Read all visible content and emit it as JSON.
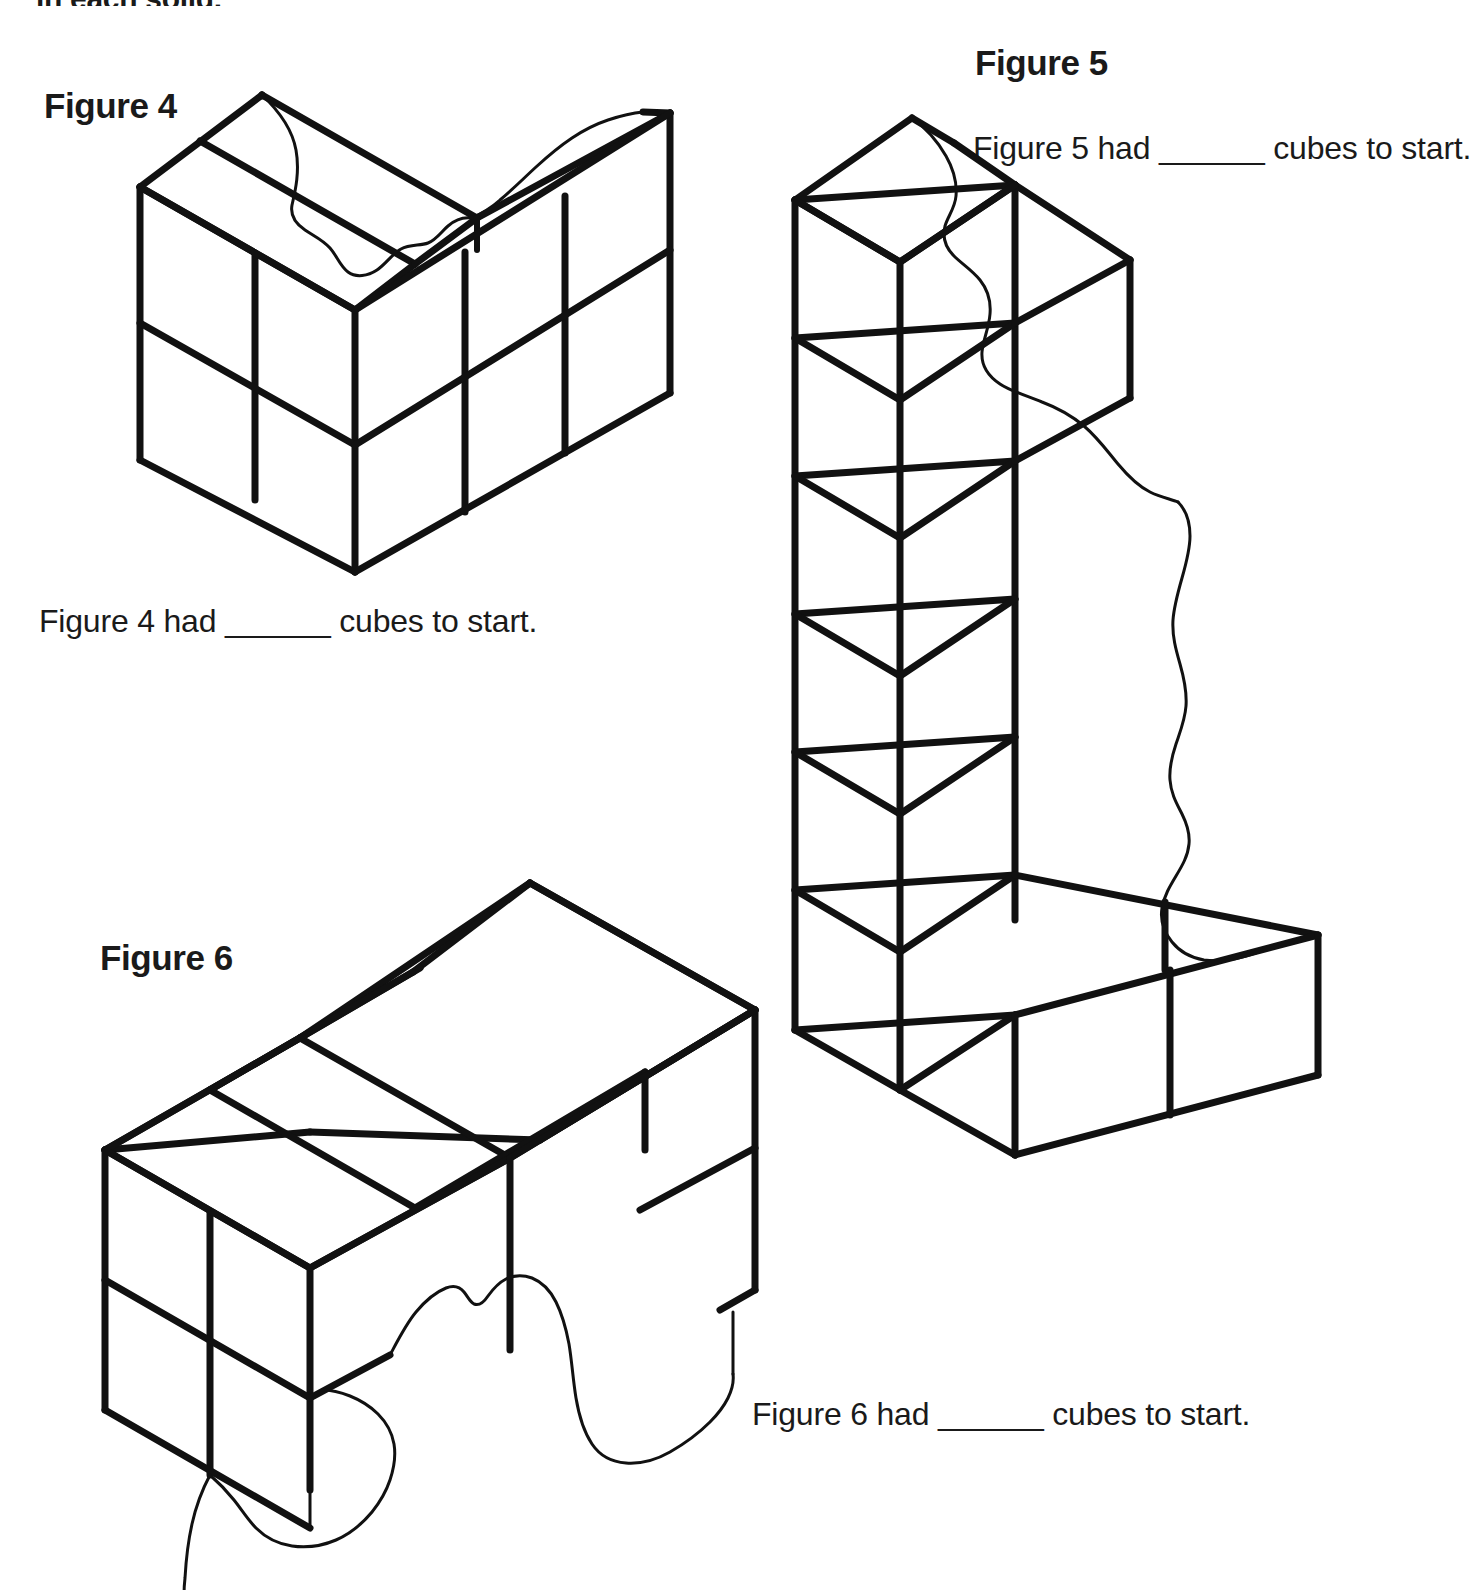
{
  "page": {
    "background_color": "#ffffff",
    "ink_color": "#111111",
    "intro_text_partial": "in each solid."
  },
  "figures": [
    {
      "id": "figure-4",
      "title": "Figure 4",
      "caption": "Figure 4 had ______ cubes to start.",
      "solid": {
        "type": "isometric-cube-stack",
        "description": "L-shaped stack of unit cubes, 2 cubes tall, with a torn/ripped top edge",
        "visible_front_columns": 2,
        "visible_right_columns": 2,
        "visible_rows": 2,
        "top_face_cells": 3
      }
    },
    {
      "id": "figure-5",
      "title": "Figure 5",
      "caption": "Figure 5 had ______ cubes to start.",
      "solid": {
        "type": "isometric-cube-stack",
        "description": "Tall wall of unit cubes, 6 rows tall and 2 columns wide, with an L-shaped foot extending right at the base and a torn/ripped right edge",
        "visible_front_columns": 2,
        "visible_rows": 6,
        "foot_cells": 2
      }
    },
    {
      "id": "figure-6",
      "title": "Figure 6",
      "caption": "Figure 6 had ______ cubes to start.",
      "solid": {
        "type": "isometric-cube-stack",
        "description": "Horizontal rectangular block of unit cubes, 3 long by 2 deep on top, 2 cubes tall, with a torn/ripped lower-right edge",
        "top_face_cells": 6,
        "visible_front_columns": 2,
        "visible_rows": 2
      }
    }
  ]
}
